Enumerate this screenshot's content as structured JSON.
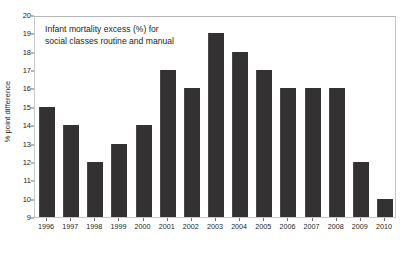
{
  "chart_data": {
    "type": "bar",
    "title": "",
    "annotation": [
      "Infant mortality excess (%) for",
      "social classes routine and manual"
    ],
    "xlabel": "",
    "ylabel": "% point difference",
    "categories": [
      "1996",
      "1997",
      "1998",
      "1999",
      "2000",
      "2001",
      "2002",
      "2003",
      "2004",
      "2005",
      "2006",
      "2007",
      "2008",
      "2009",
      "2010"
    ],
    "values": [
      15,
      14,
      12,
      13,
      14,
      17,
      16,
      19,
      18,
      17,
      16,
      16,
      16,
      12,
      10
    ],
    "ylim": [
      9,
      20
    ],
    "yticks": [
      9,
      10,
      11,
      12,
      13,
      14,
      15,
      16,
      17,
      18,
      19,
      20
    ],
    "ytick_labels": [
      "9",
      "10",
      "11",
      "12",
      "13",
      "14",
      "15",
      "16",
      "17",
      "18",
      "19",
      "20"
    ],
    "grid": false,
    "legend": "none",
    "bar_color": "#333132",
    "frame_color": "#c7c8ca",
    "text_color": "#231f20",
    "background": "#ffffff"
  }
}
